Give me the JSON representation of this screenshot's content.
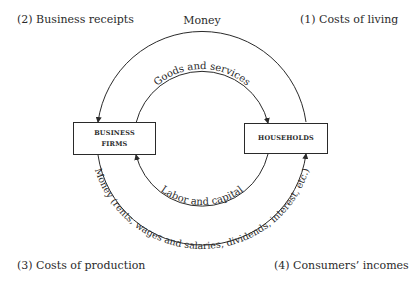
{
  "diagram": {
    "type": "circular-flow",
    "corner_labels": {
      "top_left": "(2) Business receipts",
      "top_right": "(1) Costs of living",
      "bottom_left": "(3) Costs of production",
      "bottom_right": "(4) Consumers’ incomes"
    },
    "nodes": {
      "business_firms": "BUSINESS FIRMS",
      "business_firms_line1": "BUSINESS",
      "business_firms_line2": "FIRMS",
      "households": "HOUSEHOLDS"
    },
    "flows": {
      "outer_top": "Money",
      "inner_top": "Goods and services",
      "inner_bottom": "Labor and capital",
      "outer_bottom": "Money (rents, wages and salaries, dividends, interest, etc.)"
    },
    "colors": {
      "line": "#2a2a2a",
      "background": "#ffffff"
    }
  }
}
